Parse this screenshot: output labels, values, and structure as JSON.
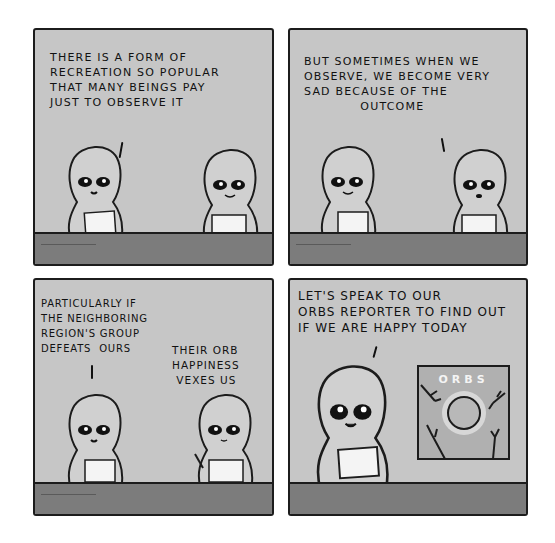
{
  "comic": {
    "colors": {
      "panel_bg": "#c6c6c6",
      "desk": "#7c7c7c",
      "ink": "#1c1c1c",
      "paper": "#f4f4f4",
      "page_bg": "#ffffff"
    },
    "panels": [
      {
        "id": 1,
        "caption": "THERE IS A FORM OF\nRECREATION SO POPULAR\nTHAT MANY BEINGS PAY\nJUST TO OBSERVE IT",
        "speaker": "left"
      },
      {
        "id": 2,
        "caption": "BUT SOMETIMES WHEN WE\nOBSERVE, WE BECOME VERY\nSAD BECAUSE OF THE\n            OUTCOME",
        "speaker": "right"
      },
      {
        "id": 3,
        "caption_left": "PARTICULARLY IF\nTHE NEIGHBORING\nREGION'S GROUP\nDEFEATS  OURS",
        "caption_right": "THEIR ORB\nHAPPINESS\n VEXES US",
        "speaker": "both"
      },
      {
        "id": 4,
        "caption": "LET'S SPEAK TO OUR\nORBS REPORTER TO FIND OUT\nIF WE ARE HAPPY TODAY",
        "speaker": "left",
        "screen_title": "ORBS"
      }
    ]
  }
}
